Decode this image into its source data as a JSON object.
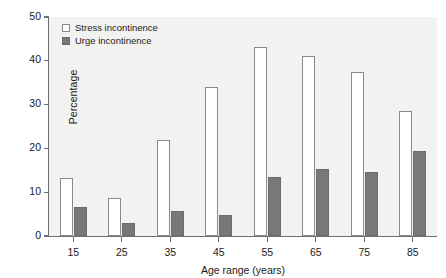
{
  "chart_data": {
    "type": "bar",
    "title": "",
    "xlabel": "Age range (years)",
    "ylabel": "Percentage",
    "categories": [
      "15",
      "25",
      "35",
      "45",
      "55",
      "65",
      "75",
      "85"
    ],
    "series": [
      {
        "name": "Stress incontinence",
        "color": "#ffffff",
        "values": [
          13.3,
          8.7,
          22.0,
          34.0,
          43.2,
          41.2,
          37.4,
          28.5
        ]
      },
      {
        "name": "Urge incontinence",
        "color": "#787878",
        "values": [
          6.6,
          3.0,
          5.6,
          4.8,
          13.5,
          15.4,
          14.7,
          19.3
        ]
      }
    ],
    "ylim": [
      0,
      50
    ],
    "yticks": [
      0,
      10,
      20,
      30,
      40,
      50
    ],
    "ytick_labels": [
      "0",
      "10",
      "20",
      "30",
      "40",
      "50"
    ],
    "grid": false,
    "legend_position": "top-left",
    "plot_background": "#f2f2f1",
    "axis_color": "#6e6e6e"
  },
  "legend": {
    "items": [
      {
        "label": "Stress incontinence",
        "swatch": "stress"
      },
      {
        "label": "Urge incontinence",
        "swatch": "urge"
      }
    ]
  },
  "axes": {
    "y_title": "Percentage",
    "x_title": "Age range (years)"
  }
}
